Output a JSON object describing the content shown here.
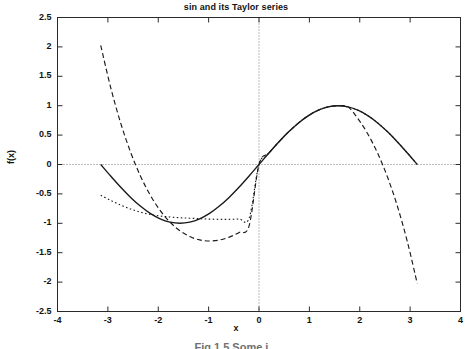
{
  "chart_data": {
    "type": "line",
    "title": "sin and its Taylor series",
    "xlabel": "x",
    "ylabel": "f(x)",
    "xlim": [
      -4,
      4
    ],
    "ylim": [
      -2.5,
      2.5
    ],
    "xticks": [
      "-4",
      "-3",
      "-2",
      "-1",
      "0",
      "1",
      "2",
      "3",
      "4"
    ],
    "xtick_values": [
      -4,
      -3,
      -2,
      -1,
      0,
      1,
      2,
      3,
      4
    ],
    "yticks": [
      "2.5",
      "2",
      "1.5",
      "1",
      "0.5",
      "0",
      "-0.5",
      "-1",
      "-1.5",
      "-2",
      "-2.5"
    ],
    "ytick_values": [
      2.5,
      2,
      1.5,
      1,
      0.5,
      0,
      -0.5,
      -1,
      -1.5,
      -2,
      -2.5
    ],
    "grid": false,
    "zero_lines": true,
    "legend_position": "none",
    "data_x_range": [
      -3.14159,
      3.14159
    ],
    "series": [
      {
        "name": "sin(x)",
        "style": "solid",
        "color": "#1a1a1a",
        "x": [
          -3.14159,
          -2.9452,
          -2.7489,
          -2.5525,
          -2.3562,
          -2.1598,
          -1.9635,
          -1.7671,
          -1.5708,
          -1.3744,
          -1.1781,
          -0.9817,
          -0.7854,
          -0.589,
          -0.3927,
          -0.1963,
          0,
          0.1963,
          0.3927,
          0.589,
          0.7854,
          0.9817,
          1.1781,
          1.3744,
          1.5708,
          1.7671,
          1.9635,
          2.1598,
          2.3562,
          2.5525,
          2.7489,
          2.9452,
          3.14159
        ],
        "y": [
          0,
          -0.1951,
          -0.3827,
          -0.5556,
          -0.7071,
          -0.8315,
          -0.9239,
          -0.9808,
          -1,
          -0.9808,
          -0.9239,
          -0.8315,
          -0.7071,
          -0.5556,
          -0.3827,
          -0.1951,
          0,
          0.1951,
          0.3827,
          0.5556,
          0.7071,
          0.8315,
          0.9239,
          0.9808,
          1,
          0.9808,
          0.9239,
          0.8315,
          0.7071,
          0.5556,
          0.3827,
          0.1951,
          0
        ]
      },
      {
        "name": "x - x^3/3!",
        "style": "dashed",
        "color": "#1a1a1a",
        "x": [
          -3.14159,
          -2.9452,
          -2.7489,
          -2.5525,
          -2.3562,
          -2.1598,
          -1.9635,
          -1.7671,
          -1.5708,
          -1.3744,
          -1.1781,
          -0.9817,
          -0.7854,
          -0.589,
          -0.3927,
          -0.1963,
          0,
          0.1963,
          0.3927,
          0.589,
          0.7854,
          0.9817,
          1.1781,
          1.3744,
          1.5708,
          1.7671,
          1.9635,
          2.1598,
          2.3562,
          2.5525,
          2.7489,
          2.9452,
          3.14159
        ],
        "y": [
          2.0261,
          1.3122,
          0.7137,
          0.2172,
          -0.1902,
          -0.5194,
          -0.7799,
          -0.9799,
          -1.1265,
          -1.2258,
          -1.2827,
          -1.3013,
          -1.2847,
          -1.2353,
          -1.1545,
          -1.0431,
          0,
          0.1951,
          0.3827,
          0.5556,
          0.7071,
          0.8315,
          0.9239,
          0.9808,
          1,
          0.9799,
          0.7799,
          0.5194,
          0.1902,
          -0.2172,
          -0.7137,
          -1.3122,
          -2.0261
        ]
      },
      {
        "name": "x - x^3/3! + x^5/5!",
        "style": "dotted",
        "color": "#1a1a1a",
        "x": [
          -3.14159,
          -2.9452,
          -2.7489,
          -2.5525,
          -2.3562,
          -2.1598,
          -1.9635,
          -1.7671,
          -1.5708,
          -1.3744,
          -1.1781,
          -0.9817,
          -0.7854,
          -0.589,
          -0.3927,
          -0.1963,
          0,
          0.1963,
          0.3927,
          0.589,
          0.7854,
          0.9817,
          1.1781,
          1.3744,
          1.5708,
          1.7671,
          1.9635,
          2.1598,
          2.3562,
          2.5525,
          2.7489,
          2.9452,
          3.14159
        ],
        "y": [
          -0.524,
          -0.6099,
          -0.6887,
          -0.7563,
          -0.8102,
          -0.8497,
          -0.8762,
          -0.8932,
          -0.9045,
          -0.9135,
          -0.9216,
          -0.9285,
          -0.9325,
          -0.9322,
          -0.9263,
          -0.9142,
          0,
          0.1951,
          0.3827,
          0.5556,
          0.7071,
          0.8315,
          0.9239,
          0.9808,
          1,
          0.9808,
          0.9239,
          0.8315,
          0.7071,
          0.5556,
          0.3827,
          0.1951,
          0
        ]
      }
    ]
  },
  "figure": {
    "caption": "Fig 1.5  Some i..."
  }
}
